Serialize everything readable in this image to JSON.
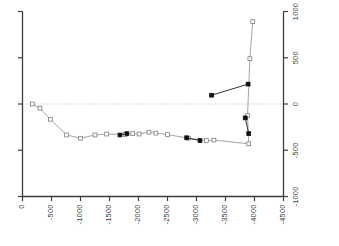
{
  "chart_data": {
    "type": "line",
    "title": "",
    "subtitle": "",
    "xlabel": "",
    "ylabel": "",
    "grid": false,
    "legend": "none",
    "orientation_note": "x axis values descend left-to-right; axis tick labels are rotated 90 degrees",
    "xlim": [
      0,
      -4500
    ],
    "ylim": [
      -1000,
      1000
    ],
    "x_ticks": [
      0,
      -500,
      -1000,
      -1500,
      -2000,
      -2500,
      -3000,
      -3500,
      -4000,
      -4500
    ],
    "x_tick_labels": [
      "0",
      "-500",
      "-1000",
      "-1500",
      "-2000",
      "-2500",
      "-3000",
      "-3500",
      "-4000",
      "-4500"
    ],
    "y_ticks": [
      1000,
      500,
      0,
      -500,
      -1000
    ],
    "y_tick_labels": [
      "1000",
      "500",
      "0",
      "-500",
      "-1000"
    ],
    "y_axis_side": "right",
    "left_axis_ticks_unlabeled": true,
    "reference_lines": [
      {
        "name": "zero-line",
        "axis": "y",
        "value": 0,
        "style": "dotted",
        "color": "#b4b4b4"
      }
    ],
    "series": [
      {
        "name": "open-marker-series",
        "marker": "open-square",
        "line_color": "#9a9a9a",
        "marker_edge_color": "#7d7d7d",
        "marker_face_color": "#ffffff",
        "points": [
          {
            "x": -170,
            "y": 0
          },
          {
            "x": -300,
            "y": -45
          },
          {
            "x": -480,
            "y": -165
          },
          {
            "x": -760,
            "y": -335
          },
          {
            "x": -1000,
            "y": -370
          },
          {
            "x": -1250,
            "y": -335
          },
          {
            "x": -1450,
            "y": -325
          },
          {
            "x": -1770,
            "y": -330
          },
          {
            "x": -1900,
            "y": -320
          },
          {
            "x": -2010,
            "y": -325
          },
          {
            "x": -2180,
            "y": -305
          },
          {
            "x": -2300,
            "y": -315
          },
          {
            "x": -2500,
            "y": -330
          },
          {
            "x": -2860,
            "y": -370
          },
          {
            "x": -3170,
            "y": -395
          },
          {
            "x": -3300,
            "y": -390
          },
          {
            "x": -3900,
            "y": -430
          },
          {
            "x": -3880,
            "y": -125
          },
          {
            "x": -3920,
            "y": 490
          },
          {
            "x": -3970,
            "y": 890
          }
        ]
      },
      {
        "name": "filled-marker-series",
        "marker": "filled-square",
        "line_color": "#1c1c1c",
        "marker_edge_color": "#101010",
        "marker_face_color": "#101010",
        "points": [
          {
            "x": -3260,
            "y": 95
          },
          {
            "x": -3890,
            "y": 215
          }
        ]
      },
      {
        "name": "filled-marker-series-lower",
        "marker": "filled-square",
        "line_color": "#1c1c1c",
        "marker_edge_color": "#101010",
        "marker_face_color": "#101010",
        "points": [
          {
            "x": -3840,
            "y": -150
          },
          {
            "x": -3900,
            "y": -320
          }
        ]
      },
      {
        "name": "filled-marker-series-mid",
        "marker": "filled-square",
        "line_color": "#1c1c1c",
        "marker_edge_color": "#101010",
        "marker_face_color": "#101010",
        "points": [
          {
            "x": -1680,
            "y": -335
          },
          {
            "x": -1800,
            "y": -320
          }
        ]
      },
      {
        "name": "filled-marker-series-mid2",
        "marker": "filled-square",
        "line_color": "#1c1c1c",
        "marker_edge_color": "#101010",
        "marker_face_color": "#101010",
        "points": [
          {
            "x": -2830,
            "y": -365
          },
          {
            "x": -3060,
            "y": -395
          }
        ]
      }
    ]
  },
  "axes": {
    "frame_color": "#3d3d3d"
  }
}
